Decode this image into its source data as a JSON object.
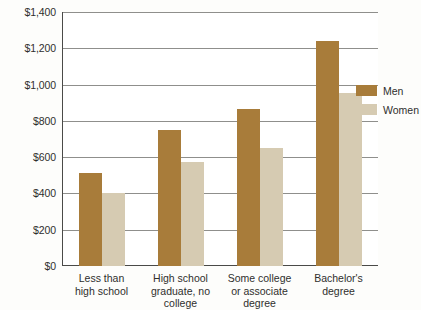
{
  "chart_data": {
    "type": "bar",
    "title": "",
    "subtitle": "",
    "xlabel": "",
    "ylabel": "",
    "ylim": [
      0,
      1400
    ],
    "ytick_values": [
      0,
      200,
      400,
      600,
      800,
      1000,
      1200,
      1400
    ],
    "ytick_labels": [
      "$0",
      "$200",
      "$400",
      "$600",
      "$800",
      "$1,000",
      "$1,200",
      "$1,400"
    ],
    "grid": true,
    "legend_position": "right",
    "categories": [
      "Less than high school",
      "High school graduate, no college",
      "Some college or associate degree",
      "Bachelor's degree"
    ],
    "category_label_lines": [
      [
        "Less than",
        "high school"
      ],
      [
        "High school",
        "graduate, no",
        "college"
      ],
      [
        "Some college",
        "or associate",
        "degree"
      ],
      [
        "Bachelor's",
        "degree"
      ]
    ],
    "series": [
      {
        "name": "Men",
        "color": "#a87c3a",
        "values": [
          515,
          750,
          865,
          1240
        ]
      },
      {
        "name": "Women",
        "color": "#d6cbb2",
        "values": [
          405,
          575,
          650,
          955
        ]
      }
    ]
  },
  "legend": {
    "items": [
      {
        "label": "Men",
        "color": "#a87c3a"
      },
      {
        "label": "Women",
        "color": "#d6cbb2"
      }
    ]
  },
  "colors": {
    "men": "#a87c3a",
    "women": "#d6cbb2",
    "axis": "#4a4a48",
    "gridline": "#8f8f8c",
    "text": "#2f2f2d",
    "page_background": "#fdfdfb",
    "plot_background": "#ffffff"
  }
}
